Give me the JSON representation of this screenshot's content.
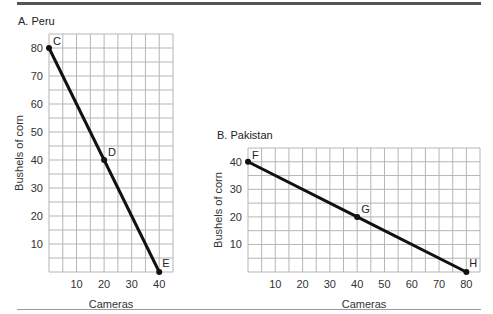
{
  "chart_data": [
    {
      "type": "line",
      "title": "A. Peru",
      "xlabel": "Cameras",
      "ylabel": "Bushels of corn",
      "xlim": [
        0,
        45
      ],
      "ylim": [
        0,
        85
      ],
      "grid": true,
      "grid_step": 5,
      "x_ticks": [
        10,
        20,
        30,
        40
      ],
      "y_ticks": [
        10,
        20,
        30,
        40,
        50,
        60,
        70,
        80
      ],
      "points": [
        {
          "label": "C",
          "x": 0,
          "y": 80
        },
        {
          "label": "D",
          "x": 20,
          "y": 40
        },
        {
          "label": "E",
          "x": 40,
          "y": 0
        }
      ]
    },
    {
      "type": "line",
      "title": "B. Pakistan",
      "xlabel": "Cameras",
      "ylabel": "Bushels of corn",
      "xlim": [
        0,
        85
      ],
      "ylim": [
        0,
        45
      ],
      "grid": true,
      "grid_step": 5,
      "x_ticks": [
        10,
        20,
        30,
        40,
        50,
        60,
        70,
        80
      ],
      "y_ticks": [
        10,
        20,
        30,
        40
      ],
      "points": [
        {
          "label": "F",
          "x": 0,
          "y": 40
        },
        {
          "label": "G",
          "x": 40,
          "y": 20
        },
        {
          "label": "H",
          "x": 80,
          "y": 0
        }
      ]
    }
  ],
  "layout": [
    {
      "left": 49,
      "top": 34,
      "right": 173,
      "bottom": 272
    },
    {
      "left": 248,
      "top": 148,
      "right": 480,
      "bottom": 272
    }
  ],
  "colors": {
    "grid": "#b5b5b5",
    "line": "#111111",
    "rule_top": "#555555",
    "rule_bottom": "#999999"
  }
}
